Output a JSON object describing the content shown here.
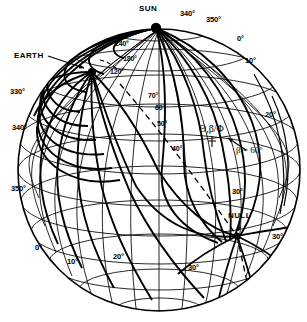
{
  "figure": {
    "type": "sphere-coordinate-diagram",
    "background": "#ffffff",
    "line_color": "#000000",
    "sphere": {
      "cx": 159,
      "cy": 170,
      "r": 141
    },
    "points": [
      {
        "name": "sun-point",
        "label": "SUN",
        "x": 156,
        "y": 27,
        "lx": 139,
        "ly": 5
      },
      {
        "name": "earth-point",
        "label": "EARTH",
        "x": 92,
        "y": 72,
        "lx": 14,
        "ly": 52
      },
      {
        "name": "null-point",
        "label": "NULL",
        "x": 237,
        "y": 235,
        "lx": 228,
        "ly": 212
      }
    ],
    "meridian_labels": [
      {
        "text": "340°",
        "x": 180,
        "y": 10,
        "class": "deg"
      },
      {
        "text": "350°",
        "x": 206,
        "y": 16,
        "class": "deg"
      },
      {
        "text": "0°",
        "x": 237,
        "y": 35,
        "class": "deg"
      },
      {
        "text": "10°",
        "x": 245,
        "y": 57,
        "class": "deg"
      },
      {
        "text": "20°",
        "x": 265,
        "y": 111,
        "class": "deg"
      },
      {
        "text": "30°",
        "x": 232,
        "y": 188,
        "class": "deg"
      },
      {
        "text": "30°",
        "x": 272,
        "y": 233,
        "class": "deg"
      },
      {
        "text": "30°",
        "x": 188,
        "y": 264,
        "class": "deg"
      },
      {
        "text": "20°",
        "x": 113,
        "y": 253,
        "class": "deg"
      },
      {
        "text": "10°",
        "x": 67,
        "y": 258,
        "class": "deg"
      },
      {
        "text": "0°",
        "x": 35,
        "y": 244,
        "class": "deg"
      },
      {
        "text": "350°",
        "x": 11,
        "y": 185,
        "class": "deg"
      },
      {
        "text": "340°",
        "x": 12,
        "y": 124,
        "class": "deg"
      },
      {
        "text": "330°",
        "x": 10,
        "y": 88,
        "class": "deg"
      }
    ],
    "field_line_labels": [
      {
        "text": "240°",
        "x": 115,
        "y": 40,
        "class": "deg-sm"
      },
      {
        "text": "180°",
        "x": 123,
        "y": 55,
        "class": "deg-sm"
      },
      {
        "text": "120°",
        "x": 110,
        "y": 68,
        "class": "deg-sm"
      },
      {
        "text": "70°",
        "x": 148,
        "y": 92,
        "class": "deg-sm"
      },
      {
        "text": "60°",
        "x": 155,
        "y": 104,
        "class": "deg-sm"
      },
      {
        "text": "50°",
        "x": 157,
        "y": 120,
        "class": "deg-sm"
      },
      {
        "text": "40°",
        "x": 172,
        "y": 145,
        "class": "deg-sm"
      }
    ],
    "annotations": {
      "theta_beta_phi": {
        "text": "Θ,β/Φ",
        "x": 199,
        "y": 124
      },
      "beta_value": {
        "text": "β = 60°",
        "x": 236,
        "y": 146
      }
    }
  }
}
